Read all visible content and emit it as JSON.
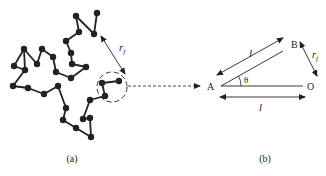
{
  "figure": {
    "panel_a": {
      "caption": "(a)",
      "radius_label": "r",
      "radius_subscript": "f",
      "chain_nodes": [
        [
          97,
          13
        ],
        [
          94,
          34
        ],
        [
          76,
          16
        ],
        [
          79,
          32
        ],
        [
          66,
          41
        ],
        [
          71,
          53
        ],
        [
          72,
          64
        ],
        [
          86,
          67
        ],
        [
          71,
          78
        ],
        [
          56,
          72
        ],
        [
          53,
          57
        ],
        [
          42,
          49
        ],
        [
          37,
          64
        ],
        [
          24,
          49
        ],
        [
          14,
          66
        ],
        [
          25,
          70
        ],
        [
          13,
          86
        ],
        [
          28,
          88
        ],
        [
          44,
          94
        ],
        [
          58,
          86
        ],
        [
          66,
          108
        ],
        [
          63,
          120
        ],
        [
          76,
          128
        ],
        [
          91,
          137
        ],
        [
          90,
          118
        ],
        [
          83,
          119
        ],
        [
          90,
          100
        ],
        [
          105,
          96
        ],
        [
          102,
          83
        ],
        [
          119,
          81
        ]
      ],
      "extra_edges": [
        [
          13,
          15
        ]
      ]
    },
    "panel_b": {
      "caption": "(b)",
      "point_a": "A",
      "point_b": "B",
      "point_o": "O",
      "angle_label": "θ",
      "bond_label_top": "l",
      "bond_label_bottom": "l",
      "radius_label": "r",
      "radius_subscript": "f"
    },
    "colors": {
      "ink": "#222222",
      "background": "#ffffff"
    }
  }
}
